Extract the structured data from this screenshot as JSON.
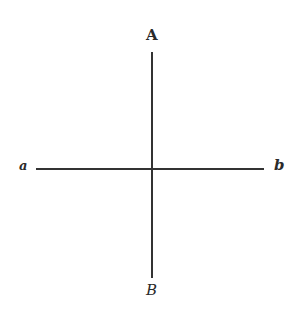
{
  "diagram": {
    "type": "cross",
    "lines": [
      {
        "name": "AB",
        "orientation": "vertical",
        "from": "A",
        "to": "B",
        "x": 152,
        "y1": 52,
        "y2": 278
      },
      {
        "name": "ab",
        "orientation": "horizontal",
        "from": "a",
        "to": "b",
        "y": 169,
        "x1": 36,
        "x2": 264
      }
    ],
    "labels": {
      "top": "A",
      "bottom": "B",
      "left": "a",
      "right": "b"
    },
    "colors": {
      "stroke": "#333333",
      "background": "#ffffff"
    }
  }
}
